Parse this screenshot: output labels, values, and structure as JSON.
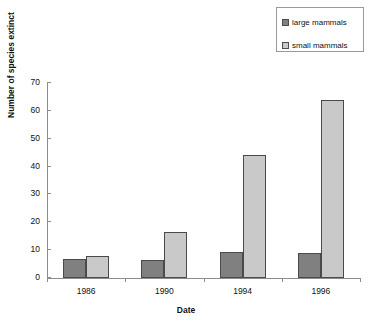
{
  "chart_data": {
    "type": "bar",
    "title": "",
    "xlabel": "Date",
    "ylabel": "Number of species extinct",
    "categories": [
      "1986",
      "1990",
      "1994",
      "1996"
    ],
    "series": [
      {
        "name": "large mammals",
        "color": "#808080",
        "values": [
          7,
          6.5,
          9.5,
          9
        ]
      },
      {
        "name": "small mammals",
        "color": "#c9c9c9",
        "values": [
          8,
          16.5,
          44,
          64
        ]
      }
    ],
    "ylim": [
      0,
      70
    ],
    "yticks": [
      0,
      10,
      20,
      30,
      40,
      50,
      60,
      70
    ],
    "ytick_labels": [
      "0",
      "10",
      "20",
      "30",
      "40",
      "50",
      "60",
      "70"
    ],
    "grid": false,
    "legend_position": "top-right"
  },
  "legend": {
    "items": [
      {
        "label": "large mammals",
        "swatch": "#808080"
      },
      {
        "label": "small mammals",
        "swatch": "#c9c9c9"
      }
    ]
  }
}
